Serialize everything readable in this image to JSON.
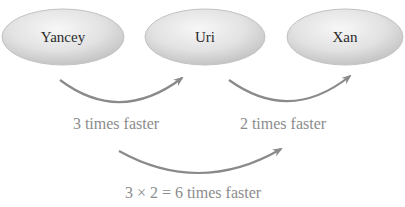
{
  "nodes": [
    {
      "id": "yancey",
      "label": "Yancey",
      "cx": 63,
      "cy": 37,
      "rx": 61,
      "ry": 28
    },
    {
      "id": "uri",
      "label": "Uri",
      "cx": 205,
      "cy": 37,
      "rx": 60,
      "ry": 28
    },
    {
      "id": "xan",
      "label": "Xan",
      "cx": 345,
      "cy": 37,
      "rx": 58,
      "ry": 28
    }
  ],
  "edges": [
    {
      "from": "Yancey",
      "to": "Uri",
      "label": "3 times faster"
    },
    {
      "from": "Uri",
      "to": "Xan",
      "label": "2 times faster"
    },
    {
      "from": "Yancey",
      "to": "Xan",
      "label": "3 × 2 = 6 times faster"
    }
  ],
  "colors": {
    "ellipse_fill_light": "#f2f2f2",
    "ellipse_fill_dark": "#c8c8c8",
    "ellipse_stroke": "#bdbdbd",
    "arrow": "#8a8a8a",
    "edge_text": "#8c8c8c",
    "node_text": "#2a2a2a"
  }
}
